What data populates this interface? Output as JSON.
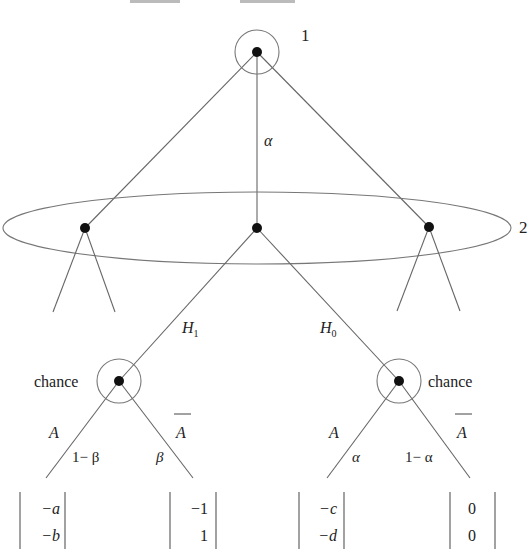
{
  "diagram": {
    "type": "extensive-form game tree",
    "title_fragment": "",
    "players": {
      "root_label": "1",
      "info_set_label": "2",
      "chance_label_left": "chance",
      "chance_label_right": "chance"
    },
    "edge_labels": {
      "root_to_middle": "α",
      "middle_left": "H",
      "middle_left_sub": "1",
      "middle_right": "H",
      "middle_right_sub": "0"
    },
    "left_chance": {
      "action_left": "A",
      "action_right": "A",
      "prob_left": "1− β",
      "prob_right": "β"
    },
    "right_chance": {
      "action_left": "A",
      "action_right": "A",
      "prob_left": "α",
      "prob_right": "1− α"
    },
    "payoffs": [
      {
        "top": "−a",
        "bottom": "−b"
      },
      {
        "top": "−1",
        "bottom": "1"
      },
      {
        "top": "−c",
        "bottom": "−d"
      },
      {
        "top": "0",
        "bottom": "0"
      }
    ]
  }
}
